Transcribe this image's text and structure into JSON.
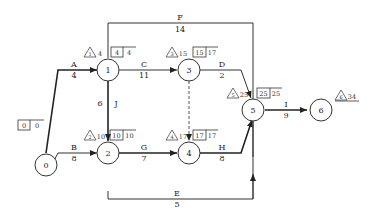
{
  "diagram": {
    "type": "activity-on-arrow network (CPM)",
    "nodes": [
      {
        "id": "0",
        "label": "0",
        "tri": "",
        "es": "0",
        "ls": "0"
      },
      {
        "id": "1",
        "label": "1",
        "tri": "1",
        "tri_val": "4",
        "es": "4",
        "ls": "4"
      },
      {
        "id": "2",
        "label": "2",
        "tri": "2",
        "tri_val": "10",
        "es": "10",
        "ls": "10"
      },
      {
        "id": "3",
        "label": "3",
        "tri": "3",
        "tri_val": "15",
        "es": "15",
        "ls": "17"
      },
      {
        "id": "4",
        "label": "4",
        "tri": "4",
        "tri_val": "17",
        "es": "17",
        "ls": "17"
      },
      {
        "id": "5",
        "label": "5",
        "tri": "5",
        "tri_val": "25",
        "es": "25",
        "ls": "25"
      },
      {
        "id": "6",
        "label": "6",
        "tri": "6",
        "tri_val": "34"
      }
    ],
    "activities": [
      {
        "name": "A",
        "duration": "4",
        "from": "0",
        "to": "1"
      },
      {
        "name": "B",
        "duration": "8",
        "from": "0",
        "to": "2"
      },
      {
        "name": "C",
        "duration": "11",
        "from": "1",
        "to": "3"
      },
      {
        "name": "J",
        "duration": "6",
        "from": "1",
        "to": "2"
      },
      {
        "name": "F",
        "duration": "14",
        "from": "1",
        "to": "5"
      },
      {
        "name": "D",
        "duration": "2",
        "from": "3",
        "to": "5"
      },
      {
        "name": "G",
        "duration": "7",
        "from": "2",
        "to": "4"
      },
      {
        "name": "E",
        "duration": "5",
        "from": "2",
        "to": "5"
      },
      {
        "name": "H",
        "duration": "8",
        "from": "4",
        "to": "5"
      },
      {
        "name": "I",
        "duration": "9",
        "from": "5",
        "to": "6"
      },
      {
        "name": "dummy",
        "duration": "",
        "from": "3",
        "to": "4"
      }
    ]
  }
}
